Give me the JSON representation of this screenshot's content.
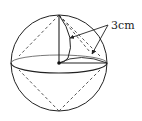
{
  "diagram": {
    "type": "geometry",
    "label": "3cm",
    "colors": {
      "stroke": "#222222",
      "background": "#ffffff"
    }
  }
}
